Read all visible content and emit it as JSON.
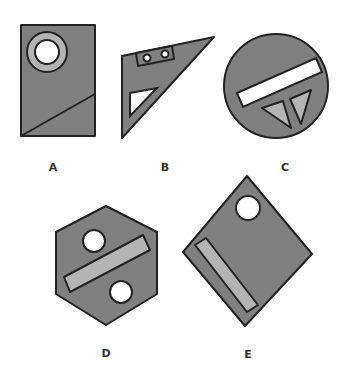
{
  "colors": {
    "body": "#808080",
    "light": "#b4b4b4",
    "hole": "#ffffff",
    "outline": "#222222"
  },
  "figures": [
    {
      "label": "A",
      "shape": "rectangle",
      "features": [
        "ring-with-hole",
        "diagonal-line"
      ]
    },
    {
      "label": "B",
      "shape": "right-triangle",
      "features": [
        "rectangle-with-two-holes",
        "triangular-cutout"
      ]
    },
    {
      "label": "C",
      "shape": "circle",
      "features": [
        "white-bar",
        "two-light-triangles"
      ]
    },
    {
      "label": "D",
      "shape": "hexagon",
      "features": [
        "two-circular-holes",
        "light-bar"
      ]
    },
    {
      "label": "E",
      "shape": "diamond",
      "features": [
        "circular-hole",
        "light-bar"
      ]
    }
  ]
}
